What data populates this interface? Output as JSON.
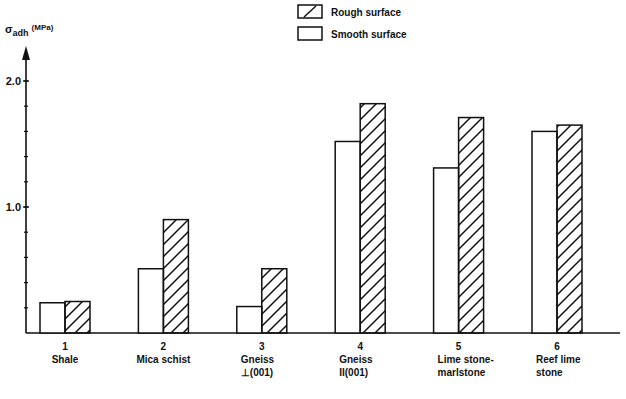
{
  "chart_data": {
    "type": "bar",
    "title": "",
    "ylabel": "σ_adh (MPa)",
    "ylabel_main": "σ",
    "ylabel_sub": "adh",
    "ylabel_unit": "(MPa)",
    "xlabel": "",
    "ylim": [
      0,
      2.0
    ],
    "yticks": [
      1.0,
      2.0
    ],
    "ytick_labels": [
      "1.0",
      "2.0"
    ],
    "minor_tick_step": 0.2,
    "grid": false,
    "legend_position": "top-right",
    "categories": [
      {
        "number": "1",
        "line1": "Shale",
        "line2": ""
      },
      {
        "number": "2",
        "line1": "Mica schist",
        "line2": ""
      },
      {
        "number": "3",
        "line1": "Gneiss",
        "line2": "⊥(001)"
      },
      {
        "number": "4",
        "line1": "Gneiss",
        "line2": "II(001)"
      },
      {
        "number": "5",
        "line1": "Lime stone-",
        "line2": "marlstone"
      },
      {
        "number": "6",
        "line1": "Reef lime",
        "line2": "stone"
      }
    ],
    "series": [
      {
        "name": "Smooth surface",
        "pattern": "plain",
        "values": [
          0.24,
          0.51,
          0.21,
          1.52,
          1.31,
          1.6
        ]
      },
      {
        "name": "Rough surface",
        "pattern": "hatched",
        "values": [
          0.25,
          0.9,
          0.51,
          1.82,
          1.71,
          1.65
        ]
      }
    ],
    "legend": [
      {
        "label": "Rough surface",
        "pattern": "hatched"
      },
      {
        "label": "Smooth surface",
        "pattern": "plain"
      }
    ]
  },
  "colors": {
    "ink": "#111111",
    "background": "#ffffff"
  }
}
